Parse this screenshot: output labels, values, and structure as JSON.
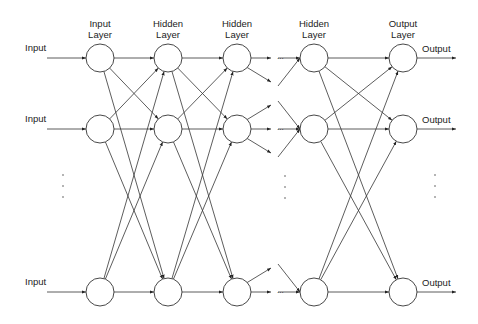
{
  "diagram": {
    "layers": [
      {
        "label_line1": "Input",
        "label_line2": "Layer",
        "x": 100
      },
      {
        "label_line1": "Hidden",
        "label_line2": "Layer",
        "x": 168
      },
      {
        "label_line1": "Hidden",
        "label_line2": "Layer",
        "x": 237
      },
      {
        "label_line1": "Hidden",
        "label_line2": "Layer",
        "x": 314
      },
      {
        "label_line1": "Output",
        "label_line2": "Layer",
        "x": 403
      }
    ],
    "rows_y": [
      58,
      129,
      292
    ],
    "node_radius": 14,
    "inputs": [
      "Input",
      "Input",
      "Input"
    ],
    "outputs": [
      "Output",
      "Output",
      "Output"
    ],
    "ellipsis": "...",
    "colors": {
      "stroke": "#333333",
      "text": "#222222",
      "background": "#ffffff"
    }
  }
}
